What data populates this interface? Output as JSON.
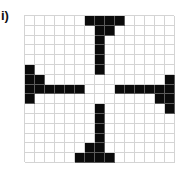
{
  "figure": {
    "label": "i)",
    "grid": {
      "rows": 15,
      "cols": 15,
      "filled_color": "#0a0a0a",
      "empty_color": "#ffffff",
      "line_color": "#d4d4d4",
      "filled_cells": [
        [
          0,
          6
        ],
        [
          0,
          7
        ],
        [
          0,
          8
        ],
        [
          0,
          9
        ],
        [
          1,
          7
        ],
        [
          1,
          8
        ],
        [
          2,
          7
        ],
        [
          3,
          7
        ],
        [
          4,
          7
        ],
        [
          5,
          7
        ],
        [
          5,
          0
        ],
        [
          6,
          0
        ],
        [
          7,
          0
        ],
        [
          8,
          0
        ],
        [
          6,
          1
        ],
        [
          7,
          1
        ],
        [
          7,
          2
        ],
        [
          7,
          3
        ],
        [
          7,
          4
        ],
        [
          7,
          5
        ],
        [
          7,
          9
        ],
        [
          7,
          10
        ],
        [
          7,
          11
        ],
        [
          7,
          12
        ],
        [
          7,
          13
        ],
        [
          7,
          14
        ],
        [
          6,
          14
        ],
        [
          8,
          14
        ],
        [
          9,
          14
        ],
        [
          8,
          13
        ],
        [
          9,
          7
        ],
        [
          10,
          7
        ],
        [
          11,
          7
        ],
        [
          12,
          7
        ],
        [
          13,
          7
        ],
        [
          14,
          7
        ],
        [
          13,
          6
        ],
        [
          14,
          5
        ],
        [
          14,
          6
        ],
        [
          14,
          8
        ]
      ]
    }
  }
}
